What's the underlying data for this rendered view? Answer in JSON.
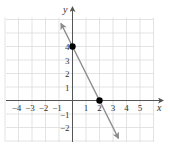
{
  "chart_data": {
    "type": "line",
    "title": "",
    "xlabel": "x",
    "ylabel": "y",
    "xlim": [
      -5,
      6
    ],
    "ylim": [
      -3,
      6
    ],
    "grid": true,
    "x_ticks": [
      -4,
      -3,
      -2,
      -1,
      1,
      2,
      3,
      4,
      5
    ],
    "x_tick_labels": [
      "−4",
      "−3",
      "−2",
      "−1",
      "1",
      "2",
      "3",
      "4",
      "5"
    ],
    "y_ticks": [
      4,
      3,
      2,
      1,
      -1,
      -2
    ],
    "y_tick_labels": [
      "4",
      "3",
      "2",
      "1",
      "−1",
      "−2"
    ],
    "series": [
      {
        "name": "line",
        "equation": "y = -2x + 4",
        "x": [
          -0.85,
          3.4
        ],
        "y": [
          5.7,
          -2.8
        ],
        "color": "#8a8a8a",
        "arrows": "both"
      }
    ],
    "points": [
      {
        "x": 0,
        "y": 4,
        "label": "y-intercept"
      },
      {
        "x": 2,
        "y": 0,
        "label": "x-intercept"
      }
    ]
  },
  "colors": {
    "grid": "#dcdcdc",
    "axis": "#555555",
    "line": "#8a8a8a",
    "point": "#000000",
    "text": "#333333"
  }
}
